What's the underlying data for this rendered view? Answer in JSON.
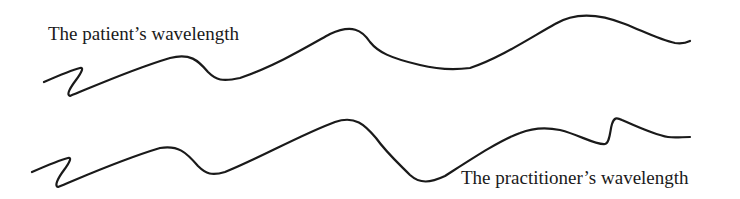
{
  "diagram": {
    "labels": {
      "patient": "The patient’s wavelength",
      "practitioner": "The practitioner’s wavelength"
    },
    "waves": [
      {
        "name": "patient-wave",
        "description": "Upper wavy line with initial zigzag, peaks near x=330 and x=580"
      },
      {
        "name": "practitioner-wave",
        "description": "Lower wavy line with initial zigzag, dip near x=410, sharp spike near x=612"
      }
    ],
    "colors": {
      "line": "#1a1a1a",
      "background": "#ffffff"
    }
  }
}
